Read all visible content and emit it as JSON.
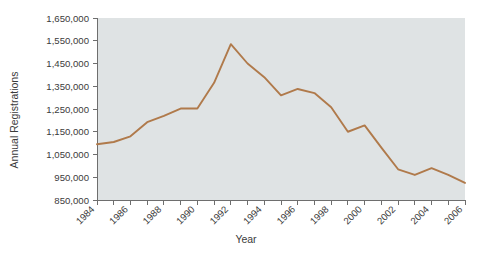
{
  "chart_data": {
    "type": "line",
    "title": "",
    "xlabel": "Year",
    "ylabel": "Annual Registrations",
    "x": [
      1984,
      1985,
      1986,
      1987,
      1988,
      1989,
      1990,
      1991,
      1992,
      1993,
      1994,
      1995,
      1996,
      1997,
      1998,
      1999,
      2000,
      2001,
      2002,
      2003,
      2004,
      2005,
      2006
    ],
    "values": [
      1095000,
      1105000,
      1130000,
      1192000,
      1220000,
      1252000,
      1252000,
      1365000,
      1535000,
      1450000,
      1390000,
      1310000,
      1338000,
      1320000,
      1258000,
      1150000,
      1178000,
      1080000,
      985000,
      960000,
      990000,
      960000,
      925000
    ],
    "series": [
      {
        "name": "Annual Registrations",
        "color": "#b07a4b",
        "values": [
          1095000,
          1105000,
          1130000,
          1192000,
          1220000,
          1252000,
          1252000,
          1365000,
          1535000,
          1450000,
          1390000,
          1310000,
          1338000,
          1320000,
          1258000,
          1150000,
          1178000,
          1080000,
          985000,
          960000,
          990000,
          960000,
          925000
        ]
      }
    ],
    "xlim": [
      1984,
      2006
    ],
    "ylim": [
      850000,
      1650000
    ],
    "y_ticks": [
      850000,
      950000,
      1050000,
      1150000,
      1250000,
      1350000,
      1450000,
      1550000,
      1650000
    ],
    "y_tick_labels": [
      "850,000",
      "950,000",
      "1,050,000",
      "1,150,000",
      "1,250,000",
      "1,350,000",
      "1,450,000",
      "1,550,000",
      "1,650,000"
    ],
    "x_ticks": [
      1984,
      1985,
      1986,
      1987,
      1988,
      1989,
      1990,
      1991,
      1992,
      1993,
      1994,
      1995,
      1996,
      1997,
      1998,
      1999,
      2000,
      2001,
      2002,
      2003,
      2004,
      2005,
      2006
    ],
    "x_tick_labels": [
      "1984",
      "",
      "1986",
      "",
      "1988",
      "",
      "1990",
      "",
      "1992",
      "",
      "1994",
      "",
      "1996",
      "",
      "1998",
      "",
      "2000",
      "",
      "2002",
      "",
      "2004",
      "",
      "2006"
    ],
    "x_labeled_years": [
      "1984",
      "1986",
      "1988",
      "1990",
      "1992",
      "1994",
      "1996",
      "1998",
      "2000",
      "2002",
      "2004",
      "2006"
    ],
    "grid": false,
    "legend": "none",
    "plot_background_color": "#dfe3e4",
    "figure_background_color": "#ffffff",
    "axis_color": "#6e6e6e",
    "text_color": "#3b3b3b"
  }
}
